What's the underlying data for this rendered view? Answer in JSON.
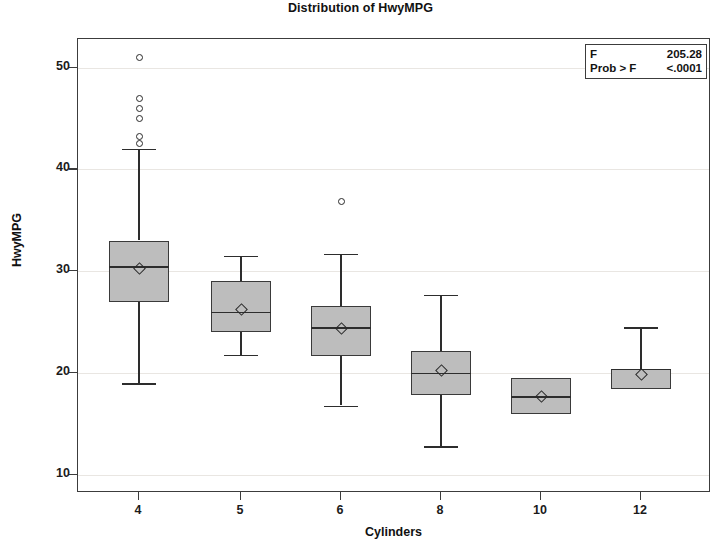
{
  "chart_data": {
    "type": "box",
    "title": "Distribution of HwyMPG",
    "xlabel": "Cylinders",
    "ylabel": "HwyMPG",
    "categories": [
      "4",
      "5",
      "6",
      "8",
      "10",
      "12"
    ],
    "ylim": [
      8.2,
      52.8
    ],
    "yticks": [
      10,
      20,
      30,
      40,
      50
    ],
    "ytick_labels": [
      "10",
      "20",
      "30",
      "40",
      "50"
    ],
    "grid": true,
    "grid_axis": "y",
    "legend": "none",
    "box_fill_color": "#bdbdbd",
    "box_line_color": "#3a3a3a",
    "boxes": [
      {
        "category": "4",
        "whisker_low": 19.0,
        "q1": 27.0,
        "median": 30.5,
        "q3": 33.0,
        "whisker_high": 42.0,
        "mean": 30.3,
        "outliers": [
          51.0,
          47.0,
          46.0,
          45.0,
          43.2,
          42.5
        ]
      },
      {
        "category": "5",
        "whisker_low": 21.8,
        "q1": 24.0,
        "median": 26.0,
        "q3": 29.0,
        "whisker_high": 31.5,
        "mean": 26.2,
        "outliers": []
      },
      {
        "category": "6",
        "whisker_low": 16.8,
        "q1": 21.7,
        "median": 24.5,
        "q3": 26.6,
        "whisker_high": 31.7,
        "mean": 24.4,
        "outliers": [
          36.8
        ]
      },
      {
        "category": "8",
        "whisker_low": 12.8,
        "q1": 17.8,
        "median": 20.0,
        "q3": 22.2,
        "whisker_high": 27.7,
        "mean": 20.2,
        "outliers": []
      },
      {
        "category": "10",
        "whisker_low": 16.0,
        "q1": 16.0,
        "median": 17.7,
        "q3": 19.5,
        "whisker_high": 19.5,
        "mean": 17.7,
        "outliers": []
      },
      {
        "category": "12",
        "whisker_low": 18.4,
        "q1": 18.4,
        "median": 20.4,
        "q3": 20.4,
        "whisker_high": 24.5,
        "mean": 19.8,
        "outliers": []
      }
    ],
    "annotations": {
      "stats_box": {
        "rows": [
          {
            "key": "F",
            "value": "205.28"
          },
          {
            "key": "Prob > F",
            "value": "<.0001"
          }
        ]
      }
    }
  }
}
